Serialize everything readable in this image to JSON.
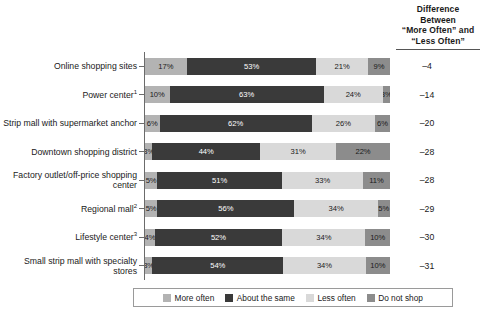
{
  "header": {
    "diff_column_title_lines": [
      "Difference",
      "Between",
      "“More Often” and",
      "“Less Often”"
    ]
  },
  "legend": {
    "items": [
      {
        "label": "More often",
        "color": "#b3b3b3",
        "key": "more"
      },
      {
        "label": "About the same",
        "color": "#3a3a3a",
        "key": "same"
      },
      {
        "label": "Less often",
        "color": "#d9d9d9",
        "key": "less"
      },
      {
        "label": "Do not shop",
        "color": "#8c8c8c",
        "key": "noshop"
      }
    ]
  },
  "chart_data": {
    "type": "bar",
    "subtype": "stacked-horizontal-100pct",
    "title": "",
    "xlabel": "",
    "ylabel": "",
    "xlim": [
      0,
      100
    ],
    "grid": false,
    "legend_position": "bottom",
    "categories": [
      "Online shopping sites",
      "Power center",
      "Strip mall with supermarket anchor",
      "Downtown shopping district",
      "Factory outlet/off-price shopping center",
      "Regional mall",
      "Lifestyle center",
      "Small strip mall with specialty stores"
    ],
    "category_footnotes": [
      "",
      "1",
      "",
      "",
      "",
      "2",
      "3",
      ""
    ],
    "series": [
      {
        "name": "More often",
        "color": "#b3b3b3",
        "values": [
          17,
          10,
          6,
          3,
          5,
          5,
          4,
          3
        ]
      },
      {
        "name": "About the same",
        "color": "#3a3a3a",
        "values": [
          53,
          63,
          62,
          44,
          51,
          56,
          52,
          54
        ]
      },
      {
        "name": "Less often",
        "color": "#d9d9d9",
        "values": [
          21,
          24,
          26,
          31,
          33,
          34,
          34,
          34
        ]
      },
      {
        "name": "Do not shop",
        "color": "#8c8c8c",
        "values": [
          9,
          3,
          6,
          22,
          11,
          5,
          10,
          10
        ]
      }
    ],
    "annotations": {
      "difference_column_label": "Difference Between “More Often” and “Less Often”",
      "difference_values": [
        -4,
        -14,
        -20,
        -28,
        -28,
        -29,
        -30,
        -31
      ]
    }
  },
  "rows": [
    {
      "label": "Online shopping sites",
      "footnote": "",
      "segments": [
        {
          "key": "more",
          "value": 17,
          "text": "17%"
        },
        {
          "key": "same",
          "value": 53,
          "text": "53%"
        },
        {
          "key": "less",
          "value": 21,
          "text": "21%"
        },
        {
          "key": "noshop",
          "value": 9,
          "text": "9%"
        }
      ],
      "difference": "–4"
    },
    {
      "label": "Power center",
      "footnote": "1",
      "segments": [
        {
          "key": "more",
          "value": 10,
          "text": "10%"
        },
        {
          "key": "same",
          "value": 63,
          "text": "63%"
        },
        {
          "key": "less",
          "value": 24,
          "text": "24%"
        },
        {
          "key": "noshop",
          "value": 3,
          "text": "3%"
        }
      ],
      "difference": "–14"
    },
    {
      "label": "Strip mall with supermarket anchor",
      "footnote": "",
      "segments": [
        {
          "key": "more",
          "value": 6,
          "text": "6%"
        },
        {
          "key": "same",
          "value": 62,
          "text": "62%"
        },
        {
          "key": "less",
          "value": 26,
          "text": "26%"
        },
        {
          "key": "noshop",
          "value": 6,
          "text": "6%"
        }
      ],
      "difference": "–20"
    },
    {
      "label": "Downtown shopping district",
      "footnote": "",
      "segments": [
        {
          "key": "more",
          "value": 3,
          "text": "3%"
        },
        {
          "key": "same",
          "value": 44,
          "text": "44%"
        },
        {
          "key": "less",
          "value": 31,
          "text": "31%"
        },
        {
          "key": "noshop",
          "value": 22,
          "text": "22%"
        }
      ],
      "difference": "–28"
    },
    {
      "label": "Factory outlet/off-price shopping center",
      "footnote": "",
      "segments": [
        {
          "key": "more",
          "value": 5,
          "text": "5%"
        },
        {
          "key": "same",
          "value": 51,
          "text": "51%"
        },
        {
          "key": "less",
          "value": 33,
          "text": "33%"
        },
        {
          "key": "noshop",
          "value": 11,
          "text": "11%"
        }
      ],
      "difference": "–28"
    },
    {
      "label": "Regional mall",
      "footnote": "2",
      "segments": [
        {
          "key": "more",
          "value": 5,
          "text": "5%"
        },
        {
          "key": "same",
          "value": 56,
          "text": "56%"
        },
        {
          "key": "less",
          "value": 34,
          "text": "34%"
        },
        {
          "key": "noshop",
          "value": 5,
          "text": "5%"
        }
      ],
      "difference": "–29"
    },
    {
      "label": "Lifestyle center",
      "footnote": "3",
      "segments": [
        {
          "key": "more",
          "value": 4,
          "text": "4%"
        },
        {
          "key": "same",
          "value": 52,
          "text": "52%"
        },
        {
          "key": "less",
          "value": 34,
          "text": "34%"
        },
        {
          "key": "noshop",
          "value": 10,
          "text": "10%"
        }
      ],
      "difference": "–30"
    },
    {
      "label": "Small strip mall with specialty stores",
      "footnote": "",
      "segments": [
        {
          "key": "more",
          "value": 3,
          "text": "3%"
        },
        {
          "key": "same",
          "value": 54,
          "text": "54%"
        },
        {
          "key": "less",
          "value": 34,
          "text": "34%"
        },
        {
          "key": "noshop",
          "value": 10,
          "text": "10%"
        }
      ],
      "difference": "–31"
    }
  ]
}
